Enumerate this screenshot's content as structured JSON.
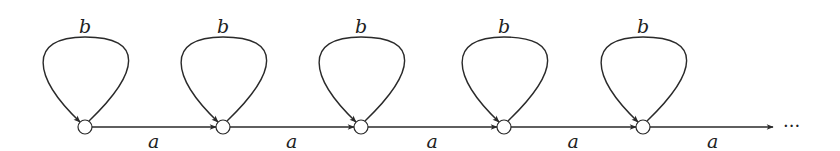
{
  "diagram": {
    "type": "state-machine",
    "colors": {
      "stroke": "#2a2a2a",
      "text": "#222222",
      "background": "#ffffff"
    },
    "states": [
      {
        "id": "s1",
        "x": 85
      },
      {
        "id": "s2",
        "x": 223
      },
      {
        "id": "s3",
        "x": 361
      },
      {
        "id": "s4",
        "x": 504
      },
      {
        "id": "s5",
        "x": 643
      }
    ],
    "self_loop_label": "b",
    "transition_label": "a",
    "self_loops": [
      {
        "state": "s1",
        "label": "b"
      },
      {
        "state": "s2",
        "label": "b"
      },
      {
        "state": "s3",
        "label": "b"
      },
      {
        "state": "s4",
        "label": "b"
      },
      {
        "state": "s5",
        "label": "b"
      }
    ],
    "transitions": [
      {
        "from": "s1",
        "to": "s2",
        "label": "a"
      },
      {
        "from": "s2",
        "to": "s3",
        "label": "a"
      },
      {
        "from": "s3",
        "to": "s4",
        "label": "a"
      },
      {
        "from": "s4",
        "to": "s5",
        "label": "a"
      },
      {
        "from": "s5",
        "to": "continuation",
        "label": "a"
      }
    ],
    "continuation": "···"
  }
}
